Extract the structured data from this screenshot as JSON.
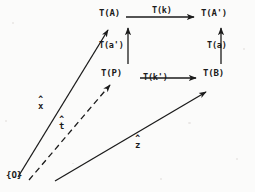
{
  "figure": {
    "type": "commutative-diagram",
    "background_color": "#fbfbfa",
    "ink_color": "#1b1b1b"
  },
  "nodes": [
    {
      "id": "TA",
      "label": "T(A)",
      "x": 99,
      "y": 8
    },
    {
      "id": "TAp",
      "label": "T(A')",
      "x": 201,
      "y": 8
    },
    {
      "id": "TP",
      "label": "T(P)",
      "x": 101,
      "y": 68
    },
    {
      "id": "TB",
      "label": "T(B)",
      "x": 203,
      "y": 68
    }
  ],
  "edges": [
    {
      "id": "top",
      "label": "T(k)",
      "from": "TA",
      "to": "TAp",
      "style": "solid",
      "label_x": 152,
      "label_y": 5
    },
    {
      "id": "bottom",
      "label": "T(k')",
      "from": "TP",
      "to": "TB",
      "style": "solid",
      "label_x": 143,
      "label_y": 72
    },
    {
      "id": "left",
      "label": "T(a')",
      "from": "TP",
      "to": "TA",
      "style": "solid",
      "label_x": 99,
      "label_y": 40
    },
    {
      "id": "right",
      "label": "T(a)",
      "from": "TB",
      "to": "TAp",
      "style": "solid",
      "label_x": 207,
      "label_y": 40
    }
  ],
  "vectors": [
    {
      "id": "x",
      "symbol": "x",
      "hat": "^",
      "style": "solid",
      "label_x": 38,
      "label_y": 98,
      "target": "TA"
    },
    {
      "id": "t",
      "symbol": "t",
      "hat": "^",
      "style": "dashed",
      "label_x": 59,
      "label_y": 118,
      "target": "TP"
    },
    {
      "id": "z",
      "symbol": "z",
      "hat": "^",
      "style": "solid",
      "label_x": 135,
      "label_y": 137,
      "target": "TB"
    }
  ],
  "origin": {
    "label": "{O}",
    "x": 6,
    "y": 170
  }
}
